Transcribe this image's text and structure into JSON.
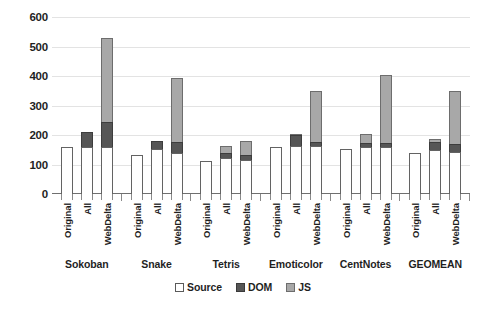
{
  "chart_data": {
    "type": "bar",
    "subtype": "stacked-grouped",
    "title": "",
    "xlabel": "",
    "ylabel": "",
    "ylim": [
      0,
      600
    ],
    "ytick_labels": [
      "0",
      "100",
      "200",
      "300",
      "400",
      "500",
      "600"
    ],
    "ytick_values": [
      0,
      100,
      200,
      300,
      400,
      500,
      600
    ],
    "grid": true,
    "grid_axis": "y",
    "legend_position": "bottom-center",
    "groups": [
      "Sokoban",
      "Snake",
      "Tetris",
      "Emoticolor",
      "CentNotes",
      "GEOMEAN"
    ],
    "subcategories": [
      "Original",
      "All",
      "WebDelta"
    ],
    "series": [
      {
        "name": "Source",
        "color": "#ffffff",
        "values": [
          [
            160,
            160,
            160
          ],
          [
            133,
            152,
            140
          ],
          [
            113,
            123,
            117
          ],
          [
            160,
            163,
            163
          ],
          [
            152,
            160,
            160
          ],
          [
            140,
            148,
            143
          ]
        ]
      },
      {
        "name": "DOM",
        "color": "#565656",
        "values": [
          [
            0,
            50,
            85
          ],
          [
            0,
            28,
            38
          ],
          [
            0,
            15,
            17
          ],
          [
            0,
            36,
            12
          ],
          [
            0,
            12,
            14
          ],
          [
            0,
            27,
            28
          ]
        ]
      },
      {
        "name": "JS",
        "color": "#a8a8a8",
        "values": [
          [
            0,
            0,
            285
          ],
          [
            0,
            0,
            215
          ],
          [
            0,
            25,
            45
          ],
          [
            0,
            5,
            173
          ],
          [
            0,
            33,
            230
          ],
          [
            0,
            13,
            178
          ]
        ]
      }
    ],
    "bar_totals": [
      [
        160,
        210,
        530
      ],
      [
        133,
        180,
        393
      ],
      [
        113,
        163,
        179
      ],
      [
        160,
        204,
        348
      ],
      [
        152,
        205,
        404
      ],
      [
        140,
        188,
        349
      ]
    ],
    "legend": [
      {
        "label": "Source",
        "swatch": "source"
      },
      {
        "label": "DOM",
        "swatch": "dom"
      },
      {
        "label": "JS",
        "swatch": "js"
      }
    ]
  }
}
